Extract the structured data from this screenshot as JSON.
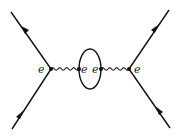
{
  "diagram": {
    "type": "feynman",
    "colors": {
      "line": "#111111",
      "background": "#ffffff",
      "label": "#222222"
    },
    "labels": {
      "left_vertex": "e",
      "loop_left": "e",
      "loop_right": "e",
      "right_vertex": "e"
    },
    "elements": {
      "fermion_lines": [
        {
          "name": "incoming-left",
          "from": [
            12,
            129
          ],
          "to": [
            51,
            69
          ],
          "arrow": "toward-vertex"
        },
        {
          "name": "outgoing-left",
          "from": [
            51,
            69
          ],
          "to": [
            11,
            12
          ],
          "arrow": "away-from-vertex"
        },
        {
          "name": "incoming-right",
          "from": [
            170,
            128
          ],
          "to": [
            129,
            69
          ],
          "arrow": "toward-vertex"
        },
        {
          "name": "outgoing-right",
          "from": [
            129,
            69
          ],
          "to": [
            169,
            10
          ],
          "arrow": "away-from-vertex"
        }
      ],
      "photon_lines": [
        {
          "name": "photon-left",
          "from": [
            51,
            69
          ],
          "to": [
            79,
            69
          ]
        },
        {
          "name": "photon-right",
          "from": [
            101,
            69
          ],
          "to": [
            129,
            69
          ]
        }
      ],
      "loop": {
        "center": [
          90,
          69
        ],
        "rx": 11,
        "ry": 20
      }
    }
  }
}
